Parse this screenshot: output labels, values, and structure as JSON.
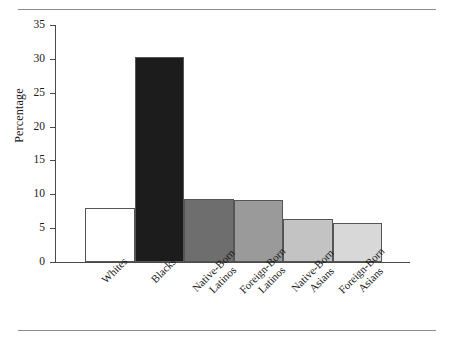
{
  "chart_data": {
    "type": "bar",
    "title": "",
    "subtitle": "",
    "xlabel": "",
    "ylabel": "Percentage",
    "ylim": [
      0,
      35
    ],
    "yticks": [
      0,
      5,
      10,
      15,
      20,
      25,
      30,
      35
    ],
    "grid": false,
    "legend": null,
    "categories": [
      "Whites",
      "Native-Born Latinos",
      "Foreign-Born Latinos",
      "Native-Born Asians",
      "Foreign-Born Asians",
      "Blacks"
    ],
    "bars": [
      {
        "label_line1": "Whites",
        "label_line2": "",
        "value": 8.0,
        "color": "#ffffff"
      },
      {
        "label_line1": "Blacks",
        "label_line2": "",
        "value": 30.3,
        "color": "#1c1c1c"
      },
      {
        "label_line1": "Native-Born",
        "label_line2": "Latinos",
        "value": 9.3,
        "color": "#6e6e6e"
      },
      {
        "label_line1": "Foreign-Born",
        "label_line2": "Latinos",
        "value": 9.1,
        "color": "#9a9a9a"
      },
      {
        "label_line1": "Native-Born",
        "label_line2": "Asians",
        "value": 6.4,
        "color": "#c3c3c3"
      },
      {
        "label_line1": "Foreign-Born",
        "label_line2": "Asians",
        "value": 5.7,
        "color": "#d8d8d8"
      }
    ],
    "values": [
      8.0,
      30.3,
      9.3,
      9.1,
      6.4,
      5.7
    ]
  },
  "axis": {
    "y_title": "Percentage",
    "ticks": [
      "0",
      "5",
      "10",
      "15",
      "20",
      "25",
      "30",
      "35"
    ]
  }
}
